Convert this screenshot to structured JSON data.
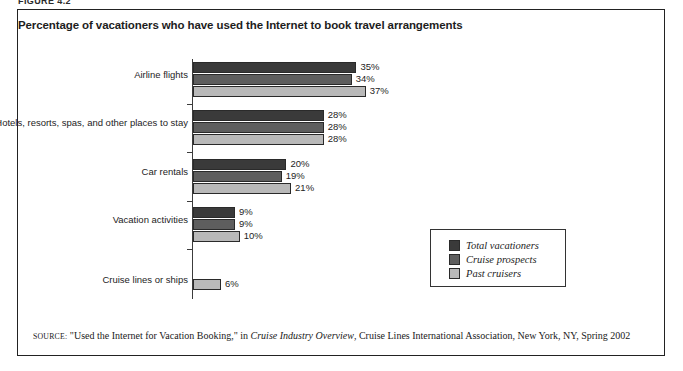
{
  "figure_label": "FIGURE 4.2",
  "chart_title": "Percentage of vacationers who have used the Internet to book travel arrangements",
  "source": {
    "label": "SOURCE:",
    "quoted_title": "\"Used the Internet for Vacation Booking,\"",
    "connector": "in",
    "publication": "Cruise Industry Overview",
    "publisher": ", Cruise Lines International Association, New York, NY, Spring 2002"
  },
  "legend": {
    "items": [
      {
        "label": "Total vacationers",
        "color": "#3a3a3a"
      },
      {
        "label": "Cruise prospects",
        "color": "#5e5e5e"
      },
      {
        "label": "Past cruisers",
        "color": "#b9b9b9"
      }
    ]
  },
  "chart_data": {
    "type": "bar",
    "orientation": "horizontal",
    "title": "Percentage of vacationers who have used the Internet to book travel arrangements",
    "xlabel": "",
    "ylabel": "",
    "xlim": [
      0,
      40
    ],
    "grid": false,
    "legend_position": "bottom-right",
    "categories": [
      "Airline flights",
      "Hotels, resorts, spas, and other places to stay",
      "Car rentals",
      "Vacation activities",
      "Cruise lines or ships"
    ],
    "series": [
      {
        "name": "Total vacationers",
        "color": "#3a3a3a",
        "values": [
          35,
          28,
          20,
          9,
          null
        ],
        "labels": [
          "35%",
          "28%",
          "20%",
          "9%",
          ""
        ]
      },
      {
        "name": "Cruise prospects",
        "color": "#5e5e5e",
        "values": [
          34,
          28,
          19,
          9,
          null
        ],
        "labels": [
          "34%",
          "28%",
          "19%",
          "9%",
          ""
        ]
      },
      {
        "name": "Past cruisers",
        "color": "#b9b9b9",
        "values": [
          37,
          28,
          21,
          10,
          6
        ],
        "labels": [
          "37%",
          "28%",
          "21%",
          "10%",
          "6%"
        ]
      }
    ]
  }
}
